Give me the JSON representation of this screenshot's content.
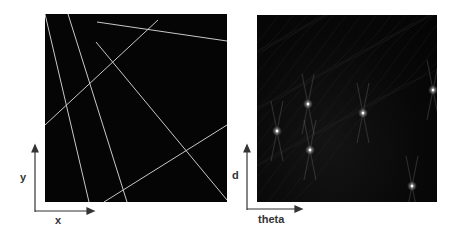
{
  "left_panel": {
    "title": "image space",
    "x_axis_label": "x",
    "y_axis_label": "y",
    "line_color": "#c8c8c8",
    "background": "#050505",
    "lines": [
      {
        "x1": 0,
        "y1": 0,
        "x2": 44,
        "y2": 188
      },
      {
        "x1": 23,
        "y1": 0,
        "x2": 82,
        "y2": 188
      },
      {
        "x1": 0,
        "y1": 111,
        "x2": 113,
        "y2": 6
      },
      {
        "x1": 52,
        "y1": 8,
        "x2": 182,
        "y2": 27
      },
      {
        "x1": 51,
        "y1": 28,
        "x2": 182,
        "y2": 186
      },
      {
        "x1": 59,
        "y1": 188,
        "x2": 182,
        "y2": 111
      }
    ]
  },
  "right_panel": {
    "title": "hough space",
    "x_axis_label": "theta",
    "y_axis_label": "d",
    "peak_color": "#ffffff",
    "peaks": [
      {
        "x": 20,
        "y": 116
      },
      {
        "x": 51,
        "y": 89
      },
      {
        "x": 53,
        "y": 135
      },
      {
        "x": 106,
        "y": 98
      },
      {
        "x": 155,
        "y": 171
      },
      {
        "x": 176,
        "y": 75
      }
    ]
  },
  "chart_data": {
    "type": "scatter",
    "panels": [
      {
        "name": "image space",
        "xlabel": "x",
        "ylabel": "y",
        "content": "6 straight white lines on black"
      },
      {
        "name": "hough accumulator",
        "xlabel": "theta",
        "ylabel": "d",
        "peaks_normalized": [
          [
            0.11,
            0.38
          ],
          [
            0.28,
            0.52
          ],
          [
            0.29,
            0.28
          ],
          [
            0.59,
            0.48
          ],
          [
            0.86,
            0.09
          ],
          [
            0.98,
            0.6
          ]
        ]
      }
    ]
  }
}
